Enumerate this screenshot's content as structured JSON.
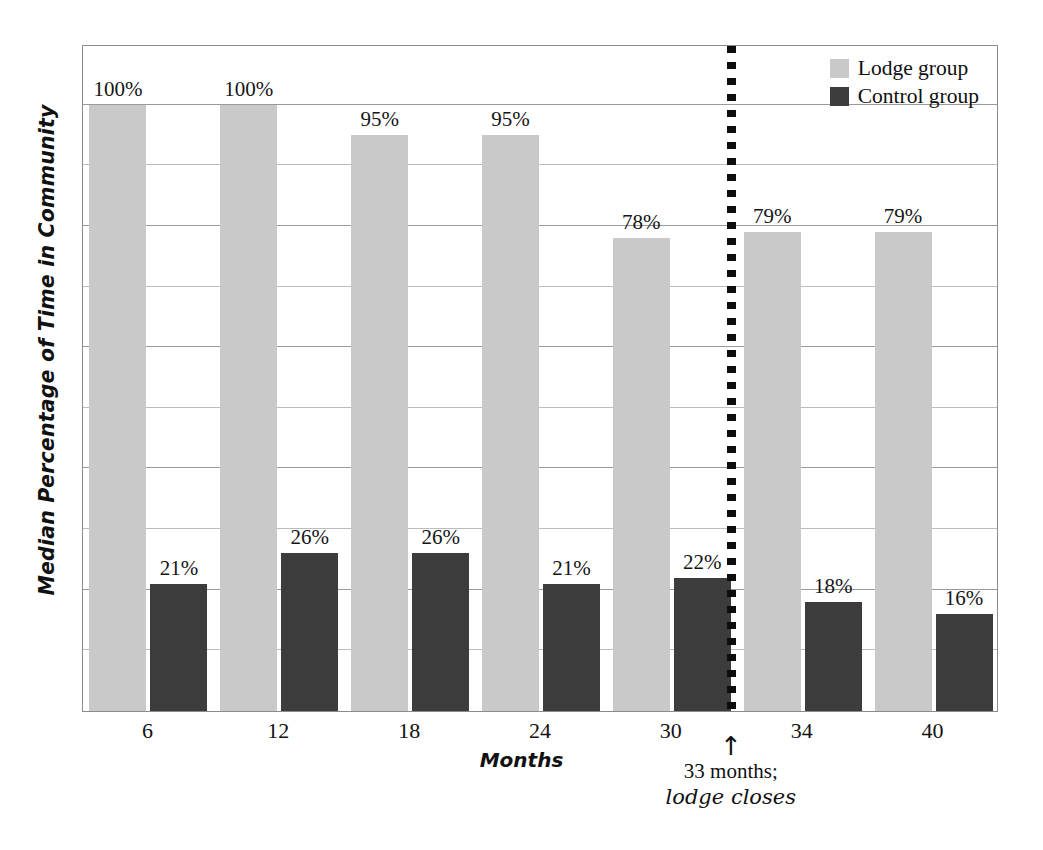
{
  "chart_data": {
    "type": "bar",
    "title": "",
    "xlabel": "Months",
    "ylabel": "Median Percentage of Time in Community",
    "categories": [
      "6",
      "12",
      "18",
      "24",
      "30",
      "34",
      "40"
    ],
    "ylim": [
      0,
      110
    ],
    "grid": true,
    "gridline_values": [
      100,
      90,
      80,
      70,
      60,
      50,
      40,
      30,
      20,
      10
    ],
    "legend_position": "top-right",
    "series": [
      {
        "name": "Lodge group",
        "color": "#c9c9c9",
        "values": [
          100,
          100,
          95,
          95,
          78,
          79,
          79
        ],
        "labels": [
          "100%",
          "100%",
          "95%",
          "95%",
          "78%",
          "79%",
          "79%"
        ]
      },
      {
        "name": "Control group",
        "color": "#3c3c3c",
        "values": [
          21,
          26,
          26,
          21,
          22,
          18,
          16
        ],
        "labels": [
          "21%",
          "26%",
          "26%",
          "21%",
          "22%",
          "18%",
          "16%"
        ]
      }
    ],
    "annotations": [
      {
        "name": "lodge-closes-marker",
        "arrow": "↑",
        "line1": "33 months;",
        "line2": "lodge closes",
        "x_value": 33,
        "style": "dotted vertical line"
      }
    ]
  },
  "legend": {
    "items": [
      {
        "label": "Lodge group",
        "color": "#c9c9c9"
      },
      {
        "label": "Control group",
        "color": "#3c3c3c"
      }
    ]
  },
  "axes": {
    "y_title": "Median Percentage of Time in Community",
    "x_title": "Months",
    "x_ticks": [
      "6",
      "12",
      "18",
      "24",
      "30",
      "34",
      "40"
    ]
  },
  "bar_labels": {
    "lodge": [
      "100%",
      "100%",
      "95%",
      "95%",
      "78%",
      "79%",
      "79%"
    ],
    "control": [
      "21%",
      "26%",
      "26%",
      "21%",
      "22%",
      "18%",
      "16%"
    ]
  },
  "marker": {
    "arrow": "↑",
    "line1": "33 months;",
    "line2": "lodge closes"
  }
}
